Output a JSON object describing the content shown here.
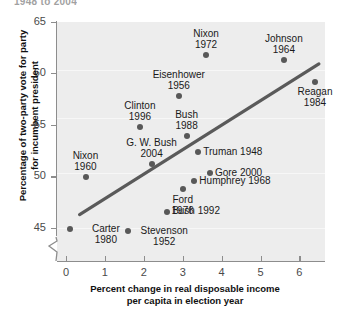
{
  "title_fragment": "1948 to 2004",
  "chart_data": {
    "type": "scatter",
    "title": "",
    "xlabel": "Percent change in real disposable income\nper capita in election year",
    "xlabel_line1": "Percent change in real disposable income",
    "xlabel_line2": "per capita in election year",
    "ylabel": "Percentage of two-party vote for party\nfor incumbent president",
    "ylabel_line1": "Percentage of two-party vote for party",
    "ylabel_line2": "for incumbent president",
    "xlim": [
      -0.3,
      6.7
    ],
    "ylim": [
      43.7,
      65.3
    ],
    "xticks": [
      0,
      1,
      2,
      3,
      4,
      5,
      6
    ],
    "xtick_labels": [
      "0",
      "1",
      "2",
      "3",
      "4",
      "5",
      "6"
    ],
    "yticks": [
      45,
      50,
      55,
      60,
      65
    ],
    "ytick_labels": [
      "45",
      "50",
      "55",
      "60",
      "65"
    ],
    "grid": true,
    "legend": "none",
    "axis_break": true,
    "marker_color": "#585858",
    "panel_color": "#ededed",
    "trend_color": "#5a5a5a",
    "trendline": {
      "x0": 0.35,
      "y0": 46.3,
      "x1": 6.5,
      "y1": 60.9
    },
    "points": [
      {
        "label": "Nixon\n1972",
        "name": "Nixon",
        "year": 1972,
        "x": 3.6,
        "y": 61.8,
        "label_pos": "above",
        "l1": "Nixon",
        "l2": "1972"
      },
      {
        "label": "Johnson\n1964",
        "name": "Johnson",
        "year": 1964,
        "x": 5.6,
        "y": 61.3,
        "label_pos": "above",
        "l1": "Johnson",
        "l2": "1964"
      },
      {
        "label": "Eisenhower\n1956",
        "name": "Eisenhower",
        "year": 1956,
        "x": 2.9,
        "y": 57.8,
        "label_pos": "above",
        "l1": "Eisenhower",
        "l2": "1956"
      },
      {
        "label": "Reagan\n1984",
        "name": "Reagan",
        "year": 1984,
        "x": 6.4,
        "y": 59.2,
        "label_pos": "below",
        "l1": "Reagan",
        "l2": "1984"
      },
      {
        "label": "Clinton\n1996",
        "name": "Clinton",
        "year": 1996,
        "x": 1.9,
        "y": 54.8,
        "label_pos": "above",
        "l1": "Clinton",
        "l2": "1996"
      },
      {
        "label": "Bush\n1988",
        "name": "Bush",
        "year": 1988,
        "x": 3.1,
        "y": 53.9,
        "label_pos": "above",
        "l1": "Bush",
        "l2": "1988"
      },
      {
        "label": "G. W. Bush\n2004",
        "name": "G. W. Bush",
        "year": 2004,
        "x": 2.2,
        "y": 51.2,
        "label_pos": "above",
        "l1": "G. W. Bush",
        "l2": "2004"
      },
      {
        "label": "Nixon\n1960",
        "name": "Nixon",
        "year": 1960,
        "x": 0.5,
        "y": 49.9,
        "label_pos": "above",
        "l1": "Nixon",
        "l2": "1960"
      },
      {
        "label": "Truman 1948",
        "name": "Truman",
        "year": 1948,
        "x": 3.4,
        "y": 52.4,
        "label_pos": "right-inline",
        "l1": "Truman 1948",
        "l2": ""
      },
      {
        "label": "Gore 2000",
        "name": "Gore",
        "year": 2000,
        "x": 3.7,
        "y": 50.3,
        "label_pos": "right-inline",
        "l1": "Gore 2000",
        "l2": ""
      },
      {
        "label": "Humphrey 1968",
        "name": "Humphrey",
        "year": 1968,
        "x": 3.3,
        "y": 49.6,
        "label_pos": "right-inline",
        "l1": "Humphrey 1968",
        "l2": ""
      },
      {
        "label": "Ford\n1976",
        "name": "Ford",
        "year": 1976,
        "x": 3.0,
        "y": 48.8,
        "label_pos": "below",
        "l1": "Ford",
        "l2": "1976"
      },
      {
        "label": "Bush 1992",
        "name": "Bush",
        "year": 1992,
        "x": 2.6,
        "y": 46.6,
        "label_pos": "right-inline",
        "l1": "Bush 1992",
        "l2": ""
      },
      {
        "label": "Carter\n1980",
        "name": "Carter",
        "year": 1980,
        "x": 0.1,
        "y": 44.9,
        "label_pos": "right-two",
        "l1": "Carter",
        "l2": "1980"
      },
      {
        "label": "Stevenson\n1952",
        "name": "Stevenson",
        "year": 1952,
        "x": 1.6,
        "y": 44.7,
        "label_pos": "right-two",
        "l1": "Stevenson",
        "l2": "1952"
      }
    ]
  }
}
